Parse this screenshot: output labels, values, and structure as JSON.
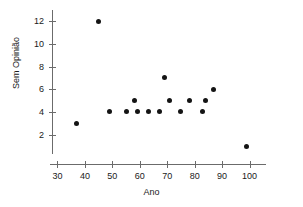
{
  "chart_data": {
    "type": "scatter",
    "title": "",
    "xlabel": "Ano",
    "ylabel": "Sem Opinião",
    "xlim": [
      28,
      106
    ],
    "ylim": [
      0.3,
      12.8
    ],
    "grid": false,
    "legend": "none",
    "xticks": [
      30,
      40,
      50,
      60,
      70,
      80,
      90,
      100
    ],
    "xtick_labels": [
      "30",
      "40",
      "50",
      "60",
      "70",
      "80",
      "90",
      "100"
    ],
    "yticks": [
      2,
      4,
      6,
      8,
      10,
      12
    ],
    "ytick_labels": [
      "2",
      "4",
      "6",
      "8",
      "10",
      "12"
    ],
    "points": [
      {
        "x": 37,
        "y": 3
      },
      {
        "x": 45,
        "y": 12
      },
      {
        "x": 49,
        "y": 4
      },
      {
        "x": 55,
        "y": 4
      },
      {
        "x": 58,
        "y": 5
      },
      {
        "x": 59,
        "y": 4
      },
      {
        "x": 63,
        "y": 4
      },
      {
        "x": 67,
        "y": 4
      },
      {
        "x": 69,
        "y": 7
      },
      {
        "x": 71,
        "y": 5
      },
      {
        "x": 75,
        "y": 4
      },
      {
        "x": 78,
        "y": 5
      },
      {
        "x": 83,
        "y": 4
      },
      {
        "x": 84,
        "y": 5
      },
      {
        "x": 87,
        "y": 6
      },
      {
        "x": 99,
        "y": 1
      }
    ],
    "marker_color": "#141414",
    "axis_color": "#6b6b6b"
  }
}
